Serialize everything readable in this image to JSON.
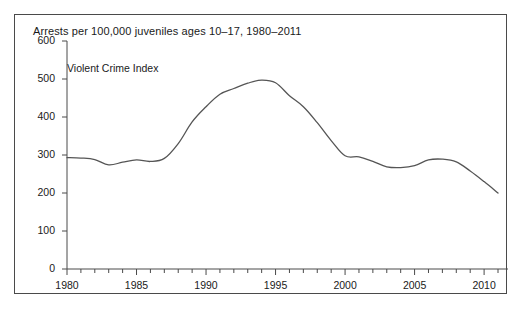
{
  "figure": {
    "title": "Arrests per 100,000 juveniles ages 10–17, 1980–2011",
    "series_label": "Violent Crime Index",
    "line_color": "#555555",
    "axis_color": "#4a4a4a",
    "border_color": "#4a4a4a",
    "background": "#ffffff"
  },
  "chart_data": {
    "type": "line",
    "title": "Arrests per 100,000 juveniles ages 10–17, 1980–2011",
    "xlabel": "",
    "ylabel": "",
    "xlim": [
      1980,
      2011
    ],
    "ylim": [
      0,
      600
    ],
    "grid": false,
    "legend": "none",
    "yticks": [
      0,
      100,
      200,
      300,
      400,
      500,
      600
    ],
    "ytick_labels": [
      "0",
      "100",
      "200",
      "300",
      "400",
      "500",
      "600"
    ],
    "xticks": [
      1980,
      1985,
      1990,
      1995,
      2000,
      2005,
      2010
    ],
    "xtick_labels": [
      "1980",
      "1985",
      "1990",
      "1995",
      "2000",
      "2005",
      "2010"
    ],
    "x_minor_tick_interval": 1,
    "series": [
      {
        "name": "Violent Crime Index",
        "x": [
          1980,
          1981,
          1982,
          1983,
          1984,
          1985,
          1986,
          1987,
          1988,
          1989,
          1990,
          1991,
          1992,
          1993,
          1994,
          1995,
          1996,
          1997,
          1998,
          1999,
          2000,
          2001,
          2002,
          2003,
          2004,
          2005,
          2006,
          2007,
          2008,
          2009,
          2010,
          2011
        ],
        "values": [
          293,
          292,
          288,
          274,
          281,
          287,
          283,
          291,
          330,
          387,
          427,
          460,
          475,
          489,
          497,
          490,
          456,
          427,
          385,
          338,
          298,
          295,
          283,
          269,
          267,
          272,
          287,
          289,
          282,
          258,
          230,
          200
        ]
      }
    ]
  }
}
